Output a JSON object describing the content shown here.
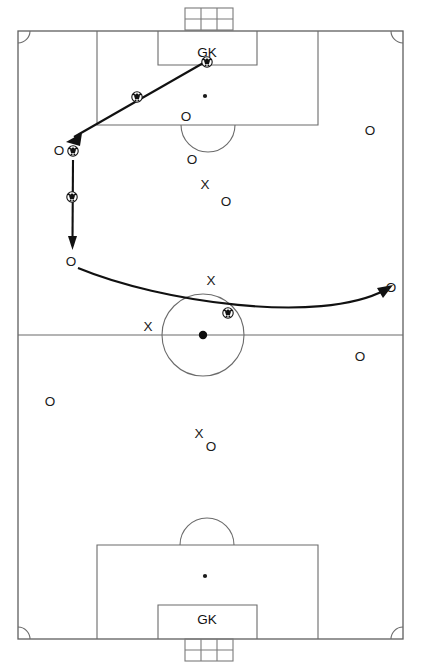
{
  "diagram": {
    "type": "soccer-play-diagram",
    "canvas": {
      "width": 421,
      "height": 667
    },
    "colors": {
      "pitch_line": "#6b6b6b",
      "movement_line": "#111111",
      "mark": "#1a1a1a",
      "background": "#ffffff"
    }
  },
  "field": {
    "boundary": {
      "x": 18,
      "y": 31,
      "width": 385,
      "height": 608
    },
    "halfway_line_y": 335,
    "corner_arc_radius": 12,
    "center_circle": {
      "cx": 203,
      "cy": 335,
      "r": 41
    },
    "kickoff_spot": {
      "cx": 203,
      "cy": 335,
      "r": 4.2
    },
    "top": {
      "penalty_box": {
        "x": 97,
        "y": 31,
        "width": 221,
        "height": 94
      },
      "goal_area": {
        "x": 158,
        "y": 31,
        "width": 99,
        "height": 34
      },
      "penalty_spot": {
        "cx": 205,
        "cy": 96,
        "r": 2.1
      },
      "penalty_arc": {
        "cx": 208,
        "cy": 125,
        "r": 27
      },
      "goal_net": {
        "x": 185,
        "y": 8,
        "width": 48,
        "height": 22,
        "cols": 3,
        "rows": 2
      },
      "gk_label": "GK",
      "gk_label_pos": {
        "x": 207,
        "y": 53
      }
    },
    "bottom": {
      "penalty_box": {
        "x": 97,
        "y": 545,
        "width": 221,
        "height": 94
      },
      "goal_area": {
        "x": 158,
        "y": 605,
        "width": 99,
        "height": 34
      },
      "penalty_spot": {
        "cx": 205,
        "cy": 576,
        "r": 2.1
      },
      "penalty_arc": {
        "cx": 207,
        "cy": 545,
        "r": 27
      },
      "goal_net": {
        "x": 185,
        "y": 639,
        "width": 48,
        "height": 22,
        "cols": 3,
        "rows": 2
      },
      "gk_label": "GK",
      "gk_label_pos": {
        "x": 207,
        "y": 620
      }
    }
  },
  "labels": {
    "offense_mark": "O",
    "defense_mark": "X",
    "goalkeeper_mark": "GK"
  },
  "players": {
    "offense": [
      {
        "id": "o-top-left-wing",
        "label": "O",
        "x": 59,
        "y": 151
      },
      {
        "id": "o-left-mid",
        "label": "O",
        "x": 71,
        "y": 262
      },
      {
        "id": "o-box-top",
        "label": "O",
        "x": 186,
        "y": 117
      },
      {
        "id": "o-box-front",
        "label": "O",
        "x": 192,
        "y": 160
      },
      {
        "id": "o-right-of-x",
        "label": "O",
        "x": 226,
        "y": 202
      },
      {
        "id": "o-right-wing-high",
        "label": "O",
        "x": 370,
        "y": 131
      },
      {
        "id": "o-right-target",
        "label": "O",
        "x": 391,
        "y": 288
      },
      {
        "id": "o-right-low",
        "label": "O",
        "x": 360,
        "y": 357
      },
      {
        "id": "o-left-low",
        "label": "O",
        "x": 50,
        "y": 402
      },
      {
        "id": "o-center-low",
        "label": "O",
        "x": 211,
        "y": 447
      }
    ],
    "defense": [
      {
        "id": "x-box-center",
        "label": "X",
        "x": 205,
        "y": 185
      },
      {
        "id": "x-circle-top",
        "label": "X",
        "x": 211,
        "y": 281
      },
      {
        "id": "x-circle-left",
        "label": "X",
        "x": 148,
        "y": 327
      },
      {
        "id": "x-low-center",
        "label": "X",
        "x": 199,
        "y": 434
      }
    ]
  },
  "balls": [
    {
      "id": "ball-gk",
      "x": 207,
      "y": 62,
      "r": 5.2
    },
    {
      "id": "ball-pass-1",
      "x": 137,
      "y": 97,
      "r": 5.2
    },
    {
      "id": "ball-receive-left",
      "x": 73,
      "y": 151,
      "r": 5.2
    },
    {
      "id": "ball-dribble-down",
      "x": 72,
      "y": 197,
      "r": 5.2
    },
    {
      "id": "ball-center-circle",
      "x": 228,
      "y": 313,
      "r": 5.2
    }
  ],
  "movements": [
    {
      "id": "pass-gk-to-left-wing",
      "kind": "pass",
      "from": {
        "x": 207,
        "y": 62
      },
      "to": {
        "x": 68,
        "y": 140
      },
      "arrow": true,
      "description": "GK distribution out to left wing"
    },
    {
      "id": "dribble-down-left",
      "kind": "dribble",
      "from": {
        "x": 73,
        "y": 160
      },
      "to": {
        "x": 72,
        "y": 248
      },
      "arrow": true,
      "description": "Carry down the left touchline"
    },
    {
      "id": "switch-to-right-wing",
      "kind": "pass",
      "from": {
        "x": 78,
        "y": 268
      },
      "control1": {
        "x": 160,
        "y": 302
      },
      "control2": {
        "x": 320,
        "y": 325
      },
      "to": {
        "x": 388,
        "y": 287
      },
      "arrow": true,
      "description": "Long switch across to right wing"
    }
  ]
}
